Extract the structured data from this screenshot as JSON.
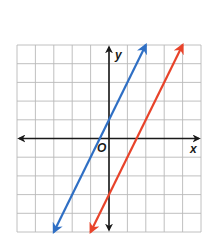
{
  "chart_data": {
    "type": "line",
    "title": "",
    "xlabel": "x",
    "ylabel": "y",
    "origin_label": "O",
    "xlim": [
      -5,
      5
    ],
    "ylim": [
      -5,
      5
    ],
    "grid": true,
    "grid_step": 1,
    "tick_labels": false,
    "legend": null,
    "series": [
      {
        "name": "blue line",
        "color": "#2f6fc4",
        "equation": "y = 2x + 1",
        "slope": 2,
        "intercept": 1,
        "x": [
          -3,
          2
        ],
        "y": [
          -5,
          5
        ],
        "arrows": "both"
      },
      {
        "name": "red line",
        "color": "#e8432a",
        "equation": "y = 2x - 3",
        "slope": 2,
        "intercept": -3,
        "x": [
          -1,
          4
        ],
        "y": [
          -5,
          5
        ],
        "arrows": "both"
      }
    ]
  },
  "labels": {
    "x_axis": "x",
    "y_axis": "y",
    "origin": "O"
  },
  "colors": {
    "grid": "#b9b9b9",
    "axis": "#1a1a1a",
    "blue": "#2f6fc4",
    "red": "#e8432a"
  }
}
